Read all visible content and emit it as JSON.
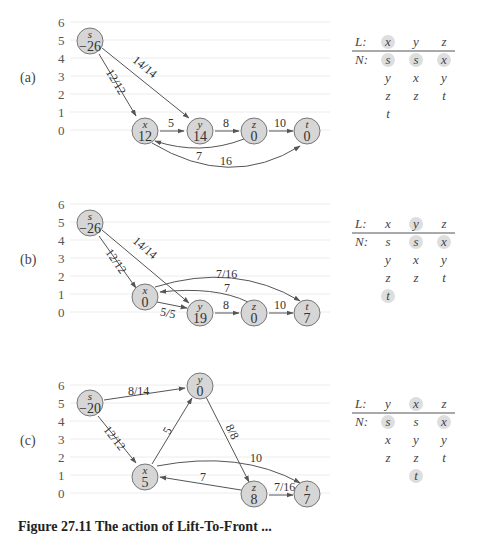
{
  "figure": {
    "caption_partial": "Figure 27.11  The action of Lift-To-Front ...",
    "axis_ticks": [
      "6",
      "5",
      "4",
      "3",
      "2",
      "1",
      "0"
    ]
  },
  "panels": [
    {
      "label": "(a)",
      "nodes": [
        {
          "id": "s",
          "name": "s",
          "value": "−26",
          "height": 5
        },
        {
          "id": "x",
          "name": "x",
          "value": "12",
          "height": 0
        },
        {
          "id": "y",
          "name": "y",
          "value": "14",
          "height": 0
        },
        {
          "id": "z",
          "name": "z",
          "value": "0",
          "height": 0
        },
        {
          "id": "t",
          "name": "t",
          "value": "0",
          "height": 0
        }
      ],
      "edges": [
        {
          "from": "s",
          "to": "x",
          "label": "12/12"
        },
        {
          "from": "s",
          "to": "y",
          "label": "14/14"
        },
        {
          "from": "x",
          "to": "y",
          "label": "5"
        },
        {
          "from": "y",
          "to": "z",
          "label": "8"
        },
        {
          "from": "z",
          "to": "t",
          "label": "10"
        },
        {
          "from": "z",
          "to": "x",
          "label": "7"
        },
        {
          "from": "x",
          "to": "t",
          "label": "16"
        }
      ],
      "table": {
        "L_label": "L:",
        "N_label": "N:",
        "L": [
          "x",
          "y",
          "z"
        ],
        "L_highlight": [
          true,
          false,
          false
        ],
        "N": [
          [
            "s",
            "y",
            "z",
            "t"
          ],
          [
            "s",
            "x",
            "z"
          ],
          [
            "x",
            "y",
            "t"
          ]
        ],
        "N_highlight": [
          [
            true,
            false,
            false,
            false
          ],
          [
            true,
            false,
            false
          ],
          [
            true,
            false,
            false
          ]
        ]
      }
    },
    {
      "label": "(b)",
      "nodes": [
        {
          "id": "s",
          "name": "s",
          "value": "−26",
          "height": 5
        },
        {
          "id": "x",
          "name": "x",
          "value": "0",
          "height": 1
        },
        {
          "id": "y",
          "name": "y",
          "value": "19",
          "height": 0
        },
        {
          "id": "z",
          "name": "z",
          "value": "0",
          "height": 0
        },
        {
          "id": "t",
          "name": "t",
          "value": "7",
          "height": 0
        }
      ],
      "edges": [
        {
          "from": "s",
          "to": "x",
          "label": "12/12"
        },
        {
          "from": "s",
          "to": "y",
          "label": "14/14"
        },
        {
          "from": "x",
          "to": "y",
          "label": "5/5"
        },
        {
          "from": "y",
          "to": "z",
          "label": "8"
        },
        {
          "from": "z",
          "to": "t",
          "label": "10"
        },
        {
          "from": "z",
          "to": "x",
          "label": "7"
        },
        {
          "from": "x",
          "to": "t",
          "label": "7/16"
        }
      ],
      "table": {
        "L_label": "L:",
        "N_label": "N:",
        "L": [
          "x",
          "y",
          "z"
        ],
        "L_highlight": [
          false,
          true,
          false
        ],
        "N": [
          [
            "s",
            "y",
            "z",
            "t"
          ],
          [
            "s",
            "x",
            "z"
          ],
          [
            "x",
            "y",
            "t"
          ]
        ],
        "N_highlight": [
          [
            false,
            false,
            false,
            true
          ],
          [
            true,
            false,
            false
          ],
          [
            true,
            false,
            false
          ]
        ]
      }
    },
    {
      "label": "(c)",
      "nodes": [
        {
          "id": "s",
          "name": "s",
          "value": "−20",
          "height": 5
        },
        {
          "id": "x",
          "name": "x",
          "value": "5",
          "height": 1
        },
        {
          "id": "y",
          "name": "y",
          "value": "0",
          "height": 6
        },
        {
          "id": "z",
          "name": "z",
          "value": "8",
          "height": 0
        },
        {
          "id": "t",
          "name": "t",
          "value": "7",
          "height": 0
        }
      ],
      "edges": [
        {
          "from": "s",
          "to": "y",
          "label": "8/14"
        },
        {
          "from": "s",
          "to": "x",
          "label": "12/12"
        },
        {
          "from": "x",
          "to": "y",
          "label": "5"
        },
        {
          "from": "y",
          "to": "z",
          "label": "8/8"
        },
        {
          "from": "x",
          "to": "t",
          "label": "7/16"
        },
        {
          "from": "z",
          "to": "x",
          "label": "7"
        },
        {
          "from": "z",
          "to": "t",
          "label": "10"
        }
      ],
      "table": {
        "L_label": "L:",
        "N_label": "N:",
        "L": [
          "y",
          "x",
          "z"
        ],
        "L_highlight": [
          false,
          true,
          false
        ],
        "N": [
          [
            "s",
            "x",
            "z"
          ],
          [
            "s",
            "y",
            "z",
            "t"
          ],
          [
            "x",
            "y",
            "t"
          ]
        ],
        "N_highlight": [
          [
            true,
            false,
            false
          ],
          [
            false,
            false,
            false,
            true
          ],
          [
            true,
            false,
            false
          ]
        ]
      }
    }
  ]
}
